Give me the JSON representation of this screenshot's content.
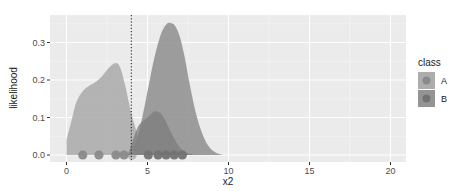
{
  "chart_data": {
    "type": "area",
    "title": "",
    "xlabel": "x2",
    "ylabel": "likelihood",
    "xlim": [
      -0.9,
      21.0
    ],
    "ylim": [
      -0.02,
      0.37
    ],
    "x_ticks": [
      0,
      5,
      10,
      15,
      20
    ],
    "x_tick_labels": [
      "0",
      "5",
      "10",
      "15",
      "20"
    ],
    "y_ticks": [
      0.0,
      0.1,
      0.2,
      0.3
    ],
    "y_tick_labels": [
      "0.0",
      "0.1",
      "0.2",
      "0.3"
    ],
    "grid": true,
    "legend": {
      "title": "class",
      "position": "right",
      "entries": [
        {
          "label": "A",
          "fill": "#a9a9a9",
          "point": "#8a8a8a"
        },
        {
          "label": "B",
          "fill": "#8e8e8e",
          "point": "#727272"
        }
      ]
    },
    "vline": {
      "x": 4.0,
      "style": "dotted",
      "color": "#1a1a1a"
    },
    "series": [
      {
        "name": "A",
        "kind": "density",
        "fill": "#a9a9a9",
        "opacity": 0.85,
        "x": [
          0.0,
          0.3,
          0.6,
          1.0,
          1.4,
          1.8,
          2.2,
          2.6,
          3.0,
          3.3,
          3.6,
          3.9,
          4.2,
          4.5,
          4.8,
          5.0
        ],
        "y": [
          0.04,
          0.09,
          0.14,
          0.17,
          0.185,
          0.195,
          0.21,
          0.232,
          0.245,
          0.235,
          0.19,
          0.13,
          0.08,
          0.04,
          0.012,
          0.0
        ]
      },
      {
        "name": "B",
        "kind": "density",
        "fill": "#8e8e8e",
        "opacity": 0.85,
        "x": [
          3.8,
          4.1,
          4.4,
          4.7,
          5.0,
          5.3,
          5.6,
          5.9,
          6.2,
          6.4,
          6.7,
          7.0,
          7.3,
          7.6,
          8.0,
          8.4,
          8.8,
          9.2,
          9.7
        ],
        "y": [
          0.0,
          0.015,
          0.05,
          0.105,
          0.17,
          0.235,
          0.29,
          0.33,
          0.35,
          0.352,
          0.345,
          0.315,
          0.26,
          0.19,
          0.11,
          0.055,
          0.022,
          0.007,
          0.0
        ]
      },
      {
        "name": "B-subset",
        "kind": "density",
        "fill": "#7c7c7c",
        "opacity": 0.75,
        "x": [
          3.8,
          4.1,
          4.4,
          4.7,
          5.0,
          5.3,
          5.5,
          5.8,
          6.1,
          6.4,
          6.7,
          7.0,
          7.4,
          7.9
        ],
        "y": [
          0.0,
          0.04,
          0.075,
          0.09,
          0.1,
          0.113,
          0.117,
          0.112,
          0.092,
          0.065,
          0.04,
          0.02,
          0.007,
          0.0
        ]
      }
    ],
    "points": [
      {
        "class": "A",
        "x": 1.0,
        "y": 0.0
      },
      {
        "class": "A",
        "x": 2.0,
        "y": 0.0
      },
      {
        "class": "A",
        "x": 3.05,
        "y": 0.0
      },
      {
        "class": "A",
        "x": 3.55,
        "y": 0.0
      },
      {
        "class": "A",
        "x": 4.05,
        "y": 0.0,
        "faded": true
      },
      {
        "class": "B",
        "x": 5.05,
        "y": 0.0
      },
      {
        "class": "B",
        "x": 5.65,
        "y": 0.0
      },
      {
        "class": "B",
        "x": 6.15,
        "y": 0.0
      },
      {
        "class": "B",
        "x": 6.65,
        "y": 0.0
      },
      {
        "class": "B",
        "x": 7.15,
        "y": 0.0
      }
    ]
  },
  "colors": {
    "panel_bg": "#ebebeb",
    "grid_major": "#ffffff",
    "grid_minor": "#f5f5f5"
  }
}
